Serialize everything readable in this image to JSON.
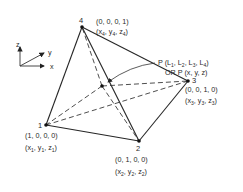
{
  "diagram": {
    "axes": {
      "z_label": "z",
      "y_label": "y",
      "x_label": "x"
    },
    "vertices": [
      {
        "id": "1",
        "label": "1",
        "natural": "(1, 0, 0, 0)",
        "cart_base": [
          "x",
          "y",
          "z"
        ],
        "cart_sub": "1",
        "pos": [
          46,
          125
        ]
      },
      {
        "id": "2",
        "label": "2",
        "natural": "(0, 1, 0, 0)",
        "cart_base": [
          "x",
          "y",
          "z"
        ],
        "cart_sub": "2",
        "pos": [
          139,
          141
        ]
      },
      {
        "id": "3",
        "label": "3",
        "natural": "(0, 0, 1, 0)",
        "cart_base": [
          "x",
          "y",
          "z"
        ],
        "cart_sub": "3",
        "pos": [
          188,
          81
        ]
      },
      {
        "id": "4",
        "label": "4",
        "natural": "(0, 0, 0, 1)",
        "cart_base": [
          "x",
          "y",
          "z"
        ],
        "cart_sub": "4",
        "pos": [
          82,
          27
        ]
      }
    ],
    "interior_point": {
      "label_line1_prefix": "P (L",
      "label_line1_subs": [
        "1",
        "2",
        "3",
        "4"
      ],
      "label_line1": "P (L1, L2, L3, L4)",
      "label_line2": "OR P (x, y, z)",
      "pos": [
        102,
        86
      ]
    },
    "edges": {
      "solid": [
        [
          "1",
          "4"
        ],
        [
          "4",
          "3"
        ],
        [
          "1",
          "2"
        ],
        [
          "2",
          "3"
        ],
        [
          "4",
          "2"
        ]
      ],
      "dashed": [
        [
          "P",
          "1"
        ],
        [
          "P",
          "2"
        ],
        [
          "P",
          "3"
        ],
        [
          "P",
          "4"
        ],
        [
          "1",
          "3"
        ]
      ]
    },
    "colors": {
      "line": "#262626",
      "text": "#2a2a2a",
      "background": "#ffffff"
    }
  }
}
